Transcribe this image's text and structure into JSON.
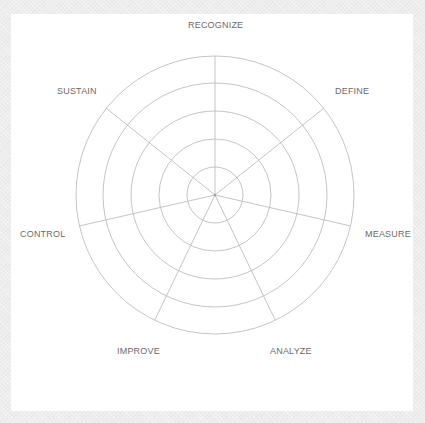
{
  "diagram": {
    "type": "radar-wheel",
    "center": {
      "x": 215,
      "y": 195
    },
    "ring_radii": [
      28,
      56,
      84,
      112,
      139
    ],
    "spoke_count": 7,
    "colors": {
      "background": "#ededed",
      "panel": "#ffffff",
      "grid_lines": "#bdbdbd",
      "label_text": "#6a6a6a"
    },
    "axes": [
      {
        "label": "RECOGNIZE",
        "x": 188,
        "y": 20
      },
      {
        "label": "DEFINE",
        "x": 335,
        "y": 86
      },
      {
        "label": "MEASURE",
        "x": 365,
        "y": 229
      },
      {
        "label": "ANALYZE",
        "x": 270,
        "y": 346
      },
      {
        "label": "IMPROVE",
        "x": 117,
        "y": 346
      },
      {
        "label": "CONTROL",
        "x": 20,
        "y": 229
      },
      {
        "label": "SUSTAIN",
        "x": 57,
        "y": 86
      }
    ]
  }
}
